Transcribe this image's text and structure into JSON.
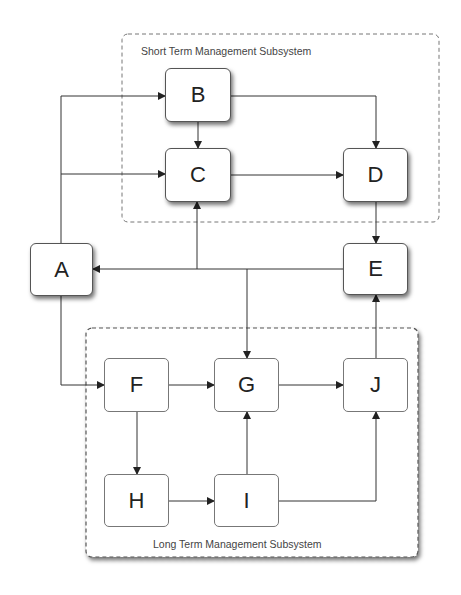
{
  "groups": {
    "short_term": {
      "label": "Short Term Management Subsystem"
    },
    "long_term": {
      "label": "Long Term Management Subsystem"
    }
  },
  "nodes": {
    "A": "A",
    "B": "B",
    "C": "C",
    "D": "D",
    "E": "E",
    "F": "F",
    "G": "G",
    "H": "H",
    "I": "I",
    "J": "J"
  },
  "edges": [
    [
      "A",
      "B"
    ],
    [
      "A",
      "C"
    ],
    [
      "A",
      "F"
    ],
    [
      "B",
      "C"
    ],
    [
      "B",
      "D"
    ],
    [
      "C",
      "D"
    ],
    [
      "D",
      "E"
    ],
    [
      "E",
      "A"
    ],
    [
      "E",
      "C"
    ],
    [
      "E",
      "G"
    ],
    [
      "F",
      "G"
    ],
    [
      "F",
      "H"
    ],
    [
      "G",
      "J"
    ],
    [
      "H",
      "I"
    ],
    [
      "I",
      "G"
    ],
    [
      "I",
      "J"
    ],
    [
      "J",
      "E"
    ]
  ]
}
